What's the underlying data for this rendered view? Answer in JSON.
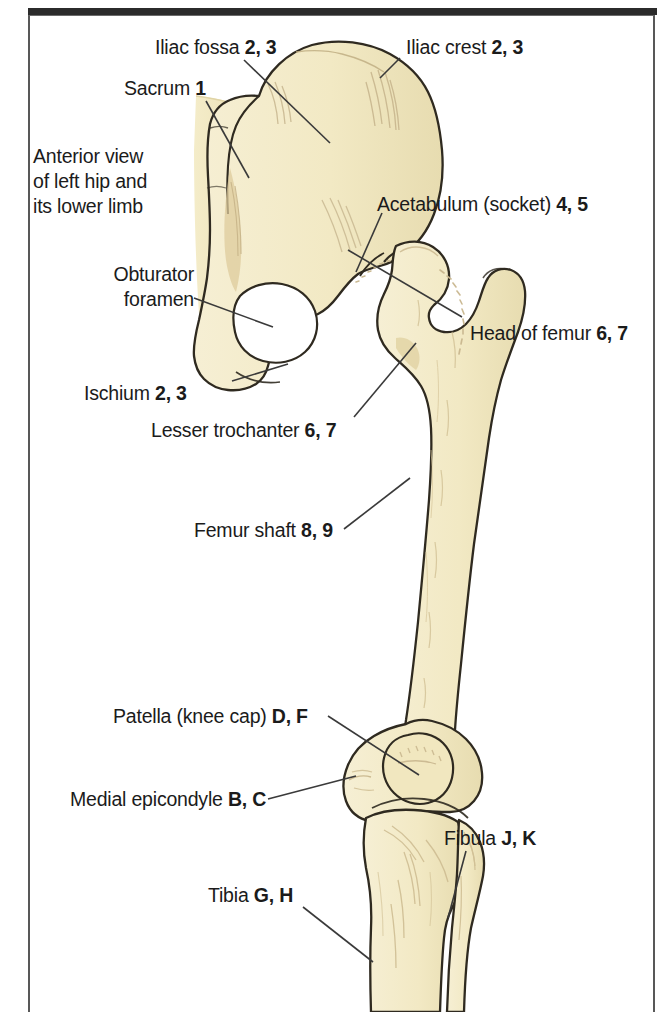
{
  "figure": {
    "title": "Anterior view of left hip and its lower limb",
    "caption_block": {
      "line1": "Anterior view",
      "line2": "of left hip and",
      "line3": "its lower limb"
    },
    "colors": {
      "bone_fill": "#f2e9c4",
      "bone_fill_shadow": "#e8dcae",
      "bone_outline": "#2f2a20",
      "sacrum_fill": "#f0e7c0",
      "cartilage_tint": "#d9c79a",
      "frame_line": "#585858",
      "top_rule": "#2b2b2b",
      "label_text": "#1b1b1b",
      "leader_line": "#3a3a3a",
      "background": "#ffffff"
    },
    "labels": [
      {
        "id": "iliac-fossa",
        "name": "Iliac fossa",
        "keys": "2, 3",
        "text": "Iliac fossa 2, 3",
        "side": "left"
      },
      {
        "id": "iliac-crest",
        "name": "Iliac crest",
        "keys": "2, 3",
        "text": "Iliac crest 2, 3",
        "side": "right"
      },
      {
        "id": "sacrum",
        "name": "Sacrum",
        "keys": "1",
        "text": "Sacrum 1",
        "side": "left"
      },
      {
        "id": "acetabulum",
        "name": "Acetabulum (socket)",
        "keys": "4, 5",
        "text": "Acetabulum (socket) 4, 5",
        "side": "right"
      },
      {
        "id": "obturator-foramen",
        "name": "Obturator foramen",
        "keys": "",
        "text": "Obturator foramen",
        "side": "left"
      },
      {
        "id": "head-of-femur",
        "name": "Head of femur",
        "keys": "6, 7",
        "text": "Head of femur 6, 7",
        "side": "right"
      },
      {
        "id": "ischium",
        "name": "Ischium",
        "keys": "2, 3",
        "text": "Ischium 2, 3",
        "side": "left"
      },
      {
        "id": "lesser-trochanter",
        "name": "Lesser trochanter",
        "keys": "6, 7",
        "text": "Lesser trochanter 6, 7",
        "side": "left"
      },
      {
        "id": "femur-shaft",
        "name": "Femur shaft",
        "keys": "8, 9",
        "text": "Femur shaft 8, 9",
        "side": "left"
      },
      {
        "id": "patella",
        "name": "Patella (knee cap)",
        "keys": "D, F",
        "text": "Patella (knee cap) D, F",
        "side": "left"
      },
      {
        "id": "medial-epicondyle",
        "name": "Medial epicondyle",
        "keys": "B, C",
        "text": "Medial epicondyle B, C",
        "side": "left"
      },
      {
        "id": "fibula",
        "name": "Fibula",
        "keys": "J, K",
        "text": "Fibula J, K",
        "side": "right"
      },
      {
        "id": "tibia",
        "name": "Tibia",
        "keys": "G, H",
        "text": "Tibia G, H",
        "side": "left"
      }
    ],
    "label_parts": {
      "iliac_fossa_name": "Iliac fossa ",
      "iliac_fossa_keys": "2, 3",
      "iliac_crest_name": "Iliac crest ",
      "iliac_crest_keys": "2, 3",
      "sacrum_name": "Sacrum ",
      "sacrum_keys": "1",
      "acetabulum_name": "Acetabulum (socket) ",
      "acetabulum_keys": "4, 5",
      "obturator_line1": "Obturator",
      "obturator_line2": "foramen",
      "head_of_femur_name": "Head of femur ",
      "head_of_femur_keys": "6, 7",
      "ischium_name": "Ischium ",
      "ischium_keys": "2, 3",
      "lesser_trochanter_name": "Lesser trochanter ",
      "lesser_trochanter_keys": "6, 7",
      "femur_shaft_name": "Femur shaft ",
      "femur_shaft_keys": "8, 9",
      "patella_name": "Patella (knee cap) ",
      "patella_keys": "D, F",
      "medial_epicondyle_name": "Medial epicondyle ",
      "medial_epicondyle_keys": "B, C",
      "fibula_name": "Fibula ",
      "fibula_keys": "J, K",
      "tibia_name": "Tibia ",
      "tibia_keys": "G, H"
    },
    "structures": [
      "sacrum",
      "ilium",
      "iliac crest",
      "iliac fossa",
      "acetabulum",
      "obturator foramen",
      "ischium",
      "pubis",
      "head of femur",
      "greater trochanter",
      "lesser trochanter",
      "femur shaft",
      "medial epicondyle",
      "lateral epicondyle",
      "patella",
      "tibia",
      "fibula"
    ]
  }
}
